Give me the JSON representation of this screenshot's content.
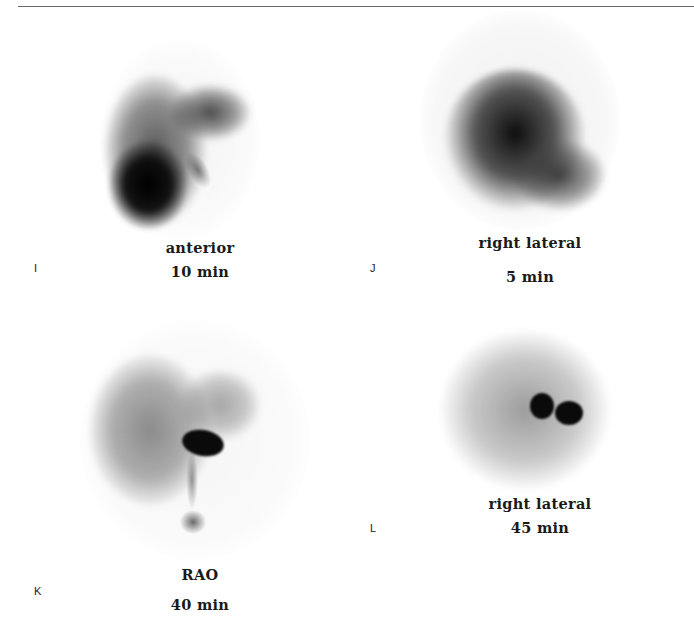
{
  "figure": {
    "panels": [
      {
        "id": "I",
        "letter": "I",
        "view": "anterior",
        "time": "10 min"
      },
      {
        "id": "J",
        "letter": "J",
        "view": "right lateral",
        "time": "5 min"
      },
      {
        "id": "K",
        "letter": "K",
        "view": "RAO",
        "time": "40 min"
      },
      {
        "id": "L",
        "letter": "L",
        "view": "right lateral",
        "time": "45 min"
      }
    ]
  }
}
